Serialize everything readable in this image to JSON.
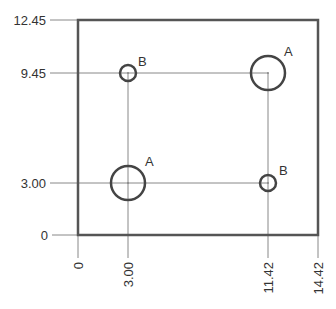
{
  "drawing": {
    "type": "ordinate-dimensioned plate with holes",
    "plate": {
      "width": 14.42,
      "height": 12.45
    },
    "y_dimensions": [
      "12.45",
      "9.45",
      "3.00",
      "0"
    ],
    "x_dimensions": [
      "0",
      "3.00",
      "11.42",
      "14.42"
    ],
    "holes": [
      {
        "label": "B",
        "x": 3.0,
        "y": 9.45,
        "size": "small"
      },
      {
        "label": "A",
        "x": 11.42,
        "y": 9.45,
        "size": "large"
      },
      {
        "label": "A",
        "x": 3.0,
        "y": 3.0,
        "size": "large"
      },
      {
        "label": "B",
        "x": 11.42,
        "y": 3.0,
        "size": "small"
      }
    ]
  },
  "labels": {
    "y_12_45": "12.45",
    "y_9_45": "9.45",
    "y_3_00": "3.00",
    "y_0": "0",
    "x_0": "0",
    "x_3_00": "3.00",
    "x_11_42": "11.42",
    "x_14_42": "14.42",
    "hole_tl": "B",
    "hole_tr": "A",
    "hole_bl": "A",
    "hole_br": "B"
  },
  "colors": {
    "outline": "#555555",
    "dimension_line": "#888888",
    "hole": "#444444",
    "text": "#333333"
  }
}
